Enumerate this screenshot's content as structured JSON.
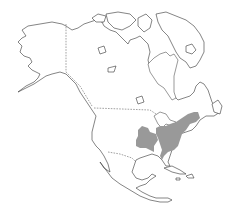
{
  "map": {
    "subject": "North America species range map",
    "region": "North America",
    "background_color": "#ffffff",
    "outline_color": "#333333",
    "range_color": "#999999",
    "range_description": "Shaded range covering the eastern United States (Great Lakes to Atlantic coast, Appalachians) with a separate western lobe in the central Plains/Ozarks",
    "borders": [
      "Alaska–Canada",
      "Canada–United States",
      "United States–Mexico"
    ],
    "labels": []
  }
}
